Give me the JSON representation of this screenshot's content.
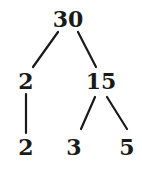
{
  "diagram": {
    "type": "factor-tree",
    "root": {
      "label": "30"
    },
    "level1": [
      {
        "label": "2"
      },
      {
        "label": "15"
      }
    ],
    "level2": [
      {
        "label": "2"
      },
      {
        "label": "3"
      },
      {
        "label": "5"
      }
    ],
    "edges": [
      {
        "from": "30",
        "to": "2"
      },
      {
        "from": "30",
        "to": "15"
      },
      {
        "from": "2",
        "to": "2"
      },
      {
        "from": "15",
        "to": "3"
      },
      {
        "from": "15",
        "to": "5"
      }
    ],
    "colors": {
      "ink": "#1a1a1a",
      "background": "#ffffff"
    }
  }
}
